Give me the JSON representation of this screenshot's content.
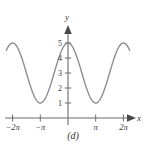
{
  "caption": "(d)",
  "axes": {
    "x_name": "x",
    "y_name": "y"
  },
  "chart_data": {
    "type": "line",
    "title": "",
    "subtitle": "",
    "xlabel": "x",
    "ylabel": "y",
    "function": "y = 3 + 2cos(x)",
    "xlim": [
      -7.4,
      7.4
    ],
    "ylim": [
      0,
      5.6
    ],
    "grid": false,
    "legend": null,
    "x_ticks": [
      -6.283185,
      -3.141593,
      3.141593,
      6.283185
    ],
    "x_tick_labels": [
      "−2π",
      "−π",
      "π",
      "2π"
    ],
    "y_ticks": [
      1,
      2,
      3,
      4,
      5
    ],
    "y_tick_labels": [
      "1",
      "2",
      "3",
      "4",
      "5"
    ],
    "series": [
      {
        "name": "y = 3 + 2cos(x)",
        "color": "#8a8a8a",
        "x": [
          -7.0,
          -6.6,
          -6.283185,
          -5.8,
          -5.4,
          -5.0,
          -4.6,
          -4.2,
          -3.8,
          -3.4,
          -3.141593,
          -2.9,
          -2.5,
          -2.1,
          -1.7,
          -1.3,
          -0.9,
          -0.5,
          -0.1,
          0.0,
          0.1,
          0.5,
          0.9,
          1.3,
          1.7,
          2.1,
          2.5,
          2.9,
          3.141593,
          3.4,
          3.8,
          4.2,
          4.6,
          5.0,
          5.4,
          5.8,
          6.283185,
          6.6,
          7.0
        ],
        "y": [
          4.508,
          4.808,
          5.0,
          4.748,
          4.269,
          3.567,
          2.778,
          1.979,
          1.42,
          1.097,
          1.0,
          1.056,
          1.397,
          1.99,
          2.743,
          3.535,
          4.243,
          4.755,
          4.99,
          5.0,
          4.99,
          4.755,
          4.243,
          3.535,
          2.743,
          1.99,
          1.397,
          1.056,
          1.0,
          1.097,
          1.42,
          1.979,
          2.778,
          3.567,
          4.269,
          4.748,
          5.0,
          4.808,
          4.508
        ],
        "x_drawn_range": [
          -7.0,
          7.0
        ],
        "maxima": [
          {
            "x": 0,
            "y": 5
          },
          {
            "x": -6.283185,
            "y": 5
          },
          {
            "x": 6.283185,
            "y": 5
          }
        ],
        "minima": [
          {
            "x": -3.141593,
            "y": 1
          },
          {
            "x": 3.141593,
            "y": 1
          }
        ]
      }
    ]
  },
  "colors": {
    "curve": "#8a8a8a",
    "axis": "#6b6b6b",
    "text": "#3a3a3a",
    "background": "#ffffff"
  }
}
